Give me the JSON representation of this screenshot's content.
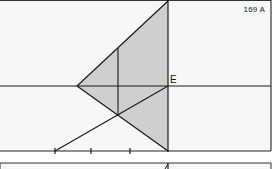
{
  "figure": {
    "label": "169 A",
    "point_labels": [
      {
        "id": "E",
        "text": "E"
      }
    ],
    "colors": {
      "background": "#f6f6f6",
      "shade": "#cfcfcf",
      "line": "#1a1a1a"
    }
  }
}
